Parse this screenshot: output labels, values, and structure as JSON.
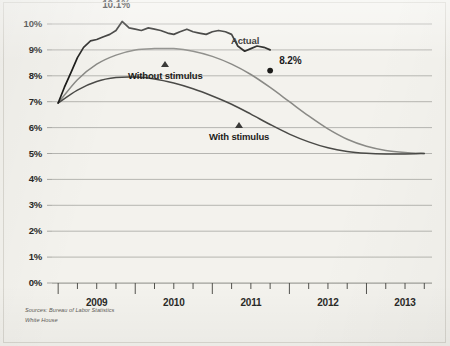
{
  "chart_data": {
    "type": "line",
    "title": "",
    "subtitle": "",
    "xlabel": "",
    "ylabel": "",
    "ylim": [
      0,
      10.6
    ],
    "xlim": [
      2008.92,
      2013.85
    ],
    "grid": true,
    "legend_position": "inline-annotations",
    "y_ticks": [
      "0%",
      "1%",
      "2%",
      "3%",
      "4%",
      "5%",
      "6%",
      "7%",
      "8%",
      "9%",
      "10%"
    ],
    "y_tick_values": [
      0,
      1,
      2,
      3,
      4,
      5,
      6,
      7,
      8,
      9,
      10
    ],
    "x_ticks": [
      "2009",
      "2010",
      "2011",
      "2012",
      "2013"
    ],
    "x_tick_values": [
      2009.5,
      2010.5,
      2011.5,
      2012.5,
      2013.5
    ],
    "x_minor_tick_values": [
      2009.0,
      2009.25,
      2009.5,
      2009.75,
      2010.0,
      2010.25,
      2010.5,
      2010.75,
      2011.0,
      2011.25,
      2011.5,
      2011.75,
      2012.0,
      2012.25,
      2012.5,
      2012.75,
      2013.0,
      2013.25,
      2013.5,
      2013.75
    ],
    "series": [
      {
        "name": "Actual",
        "color": "#1c1c1a",
        "style": "jagged",
        "x": [
          2009.0,
          2009.08,
          2009.17,
          2009.25,
          2009.33,
          2009.42,
          2009.5,
          2009.58,
          2009.67,
          2009.75,
          2009.83,
          2009.92,
          2010.0,
          2010.08,
          2010.17,
          2010.25,
          2010.33,
          2010.42,
          2010.5,
          2010.58,
          2010.67,
          2010.75,
          2010.83,
          2010.92,
          2011.0,
          2011.08,
          2011.17,
          2011.25,
          2011.33,
          2011.42,
          2011.5,
          2011.58,
          2011.67,
          2011.75
        ],
        "y": [
          6.95,
          7.55,
          8.15,
          8.7,
          9.1,
          9.35,
          9.4,
          9.5,
          9.6,
          9.75,
          10.1,
          9.85,
          9.8,
          9.75,
          9.85,
          9.8,
          9.75,
          9.65,
          9.6,
          9.7,
          9.8,
          9.7,
          9.65,
          9.6,
          9.7,
          9.75,
          9.7,
          9.6,
          9.15,
          8.95,
          9.05,
          9.15,
          9.1,
          9.0
        ]
      },
      {
        "name": "Without stimulus",
        "color": "#8a8a86",
        "style": "smooth",
        "x": [
          2009.0,
          2009.25,
          2009.5,
          2009.75,
          2010.0,
          2010.25,
          2010.5,
          2010.75,
          2011.0,
          2011.25,
          2011.5,
          2011.75,
          2012.0,
          2012.25,
          2012.5,
          2012.75,
          2013.0,
          2013.25,
          2013.5,
          2013.75
        ],
        "y": [
          6.95,
          7.85,
          8.45,
          8.8,
          9.0,
          9.05,
          9.05,
          8.95,
          8.75,
          8.45,
          8.05,
          7.55,
          7.0,
          6.45,
          5.95,
          5.55,
          5.28,
          5.12,
          5.04,
          5.0
        ]
      },
      {
        "name": "With stimulus",
        "color": "#4a4a47",
        "style": "smooth",
        "x": [
          2009.0,
          2009.25,
          2009.5,
          2009.75,
          2010.0,
          2010.25,
          2010.5,
          2010.75,
          2011.0,
          2011.25,
          2011.5,
          2011.75,
          2012.0,
          2012.25,
          2012.5,
          2012.75,
          2013.0,
          2013.25,
          2013.5,
          2013.75
        ],
        "y": [
          6.95,
          7.45,
          7.78,
          7.93,
          7.95,
          7.88,
          7.72,
          7.5,
          7.22,
          6.9,
          6.52,
          6.12,
          5.75,
          5.45,
          5.22,
          5.08,
          5.01,
          4.98,
          4.98,
          5.0
        ]
      }
    ],
    "annotations": [
      {
        "text": "10.1%",
        "series": "Actual",
        "x": 2009.83,
        "y": 10.1,
        "kind": "peak-value"
      },
      {
        "text": "8.2%",
        "series": "Actual",
        "x": 2011.75,
        "y": 8.2,
        "kind": "end-value"
      }
    ],
    "point_markers": [
      {
        "series": "Actual",
        "x": 2011.75,
        "y": 8.2,
        "shape": "dot",
        "color": "#1c1c1a"
      }
    ],
    "series_labels": [
      {
        "text": "Actual",
        "marker": "triangle-up"
      },
      {
        "text": "Without stimulus",
        "marker": "triangle-up"
      },
      {
        "text": "With stimulus",
        "marker": "triangle-up"
      }
    ]
  },
  "source_note": {
    "line1": "Sources: Bureau of Labor Statistics",
    "line2": "White House"
  },
  "colors": {
    "paper": "#f3f2ed",
    "gridline": "#9b9b96",
    "axis": "#4a4a46",
    "actual": "#1c1c1a",
    "without_stimulus": "#8a8a86",
    "with_stimulus": "#4a4a47",
    "text": "#2a2a28"
  }
}
